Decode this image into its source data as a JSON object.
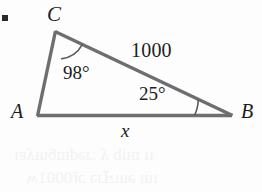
{
  "page": {
    "background_color": "#fdfdfd",
    "width": 262,
    "height": 192
  },
  "exercise": {
    "bullet": "▪"
  },
  "figure": {
    "stroke_color": "#6e6e6e",
    "arc_color": "#5a5a5a",
    "text_color": "#1c1c1c",
    "vertices": {
      "A": {
        "label": "A",
        "x": 37,
        "y": 116
      },
      "B": {
        "label": "B",
        "x": 232,
        "y": 116
      },
      "C": {
        "label": "C",
        "x": 55,
        "y": 31
      }
    },
    "sides": {
      "CB": {
        "label": "1000",
        "from": "C",
        "to": "B"
      },
      "AB": {
        "label": "x",
        "from": "A",
        "to": "B"
      },
      "AC": {
        "label": "",
        "from": "A",
        "to": "C"
      }
    },
    "angles": {
      "at_C": {
        "label": "98°",
        "value": 98,
        "unit": "degrees"
      },
      "at_B": {
        "label": "25°",
        "value": 25,
        "unit": "degrees"
      }
    }
  },
  "bleed_through": {
    "line1": "ıı ɒıib ʎ  ːɹədɯƃuıʎɐı",
    "line2": "ıuı əuıℲɹə ɔř0001ʍ"
  }
}
